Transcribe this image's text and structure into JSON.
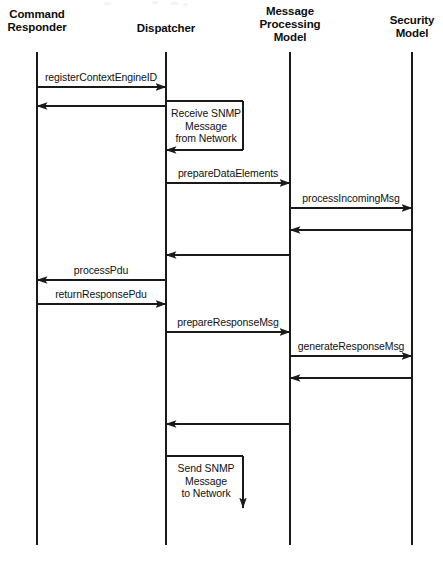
{
  "diagram": {
    "type": "uml-sequence-diagram",
    "width": 443,
    "height": 561,
    "background_color": "#ffffff",
    "line_color": "#1a1a1a",
    "text_color": "#111111",
    "lifeline_top": 52,
    "lifeline_bottom": 545
  },
  "participants": [
    {
      "id": "command-responder",
      "label": "Command\nResponder",
      "x": 37,
      "label_y": 8
    },
    {
      "id": "dispatcher",
      "label": "Dispatcher",
      "x": 166,
      "label_y": 22
    },
    {
      "id": "message-processing-model",
      "label": "Message\nProcessing\nModel",
      "x": 290,
      "label_y": 5
    },
    {
      "id": "security-model",
      "label": "Security\nModel",
      "x": 412,
      "label_y": 14
    }
  ],
  "messages": [
    {
      "id": "register-context-engine-id",
      "label": "registerContextEngineID",
      "from": "command-responder",
      "to": "dispatcher",
      "direction": "right",
      "y": 87,
      "label_x": 101,
      "label_y": 83,
      "kind": "call"
    },
    {
      "id": "register-context-engine-id-return",
      "label": "",
      "from": "dispatcher",
      "to": "command-responder",
      "direction": "left",
      "y": 106,
      "kind": "return"
    },
    {
      "id": "receive-snmp-message-from-network",
      "label": "Receive SNMP\nMessage\nfrom Network",
      "from": "dispatcher",
      "to": "dispatcher",
      "direction": "self-in",
      "y_top": 101,
      "y_bottom": 150,
      "x_out": 243,
      "label_x": 206,
      "label_y": 107,
      "kind": "self"
    },
    {
      "id": "prepare-data-elements",
      "label": "prepareDataElements",
      "from": "dispatcher",
      "to": "message-processing-model",
      "direction": "right",
      "y": 183,
      "label_x": 228,
      "label_y": 179,
      "kind": "call"
    },
    {
      "id": "process-incoming-msg",
      "label": "processIncomingMsg",
      "from": "message-processing-model",
      "to": "security-model",
      "direction": "right",
      "y": 208,
      "label_x": 351,
      "label_y": 204,
      "kind": "call"
    },
    {
      "id": "process-incoming-msg-return",
      "label": "",
      "from": "security-model",
      "to": "message-processing-model",
      "direction": "left",
      "y": 230,
      "kind": "return"
    },
    {
      "id": "prepare-data-elements-return",
      "label": "",
      "from": "message-processing-model",
      "to": "dispatcher",
      "direction": "left",
      "y": 255,
      "kind": "return"
    },
    {
      "id": "process-pdu",
      "label": "processPdu",
      "from": "dispatcher",
      "to": "command-responder",
      "direction": "left",
      "y": 280,
      "label_x": 101,
      "label_y": 276,
      "kind": "call"
    },
    {
      "id": "return-response-pdu",
      "label": "returnResponsePdu",
      "from": "command-responder",
      "to": "dispatcher",
      "direction": "right",
      "y": 304,
      "label_x": 101,
      "label_y": 300,
      "kind": "call"
    },
    {
      "id": "prepare-response-msg",
      "label": "prepareResponseMsg",
      "from": "dispatcher",
      "to": "message-processing-model",
      "direction": "right",
      "y": 332,
      "label_x": 228,
      "label_y": 328,
      "kind": "call"
    },
    {
      "id": "generate-response-msg",
      "label": "generateResponseMsg",
      "from": "message-processing-model",
      "to": "security-model",
      "direction": "right",
      "y": 356,
      "label_x": 351,
      "label_y": 352,
      "kind": "call"
    },
    {
      "id": "generate-response-msg-return",
      "label": "",
      "from": "security-model",
      "to": "message-processing-model",
      "direction": "left",
      "y": 378,
      "kind": "return"
    },
    {
      "id": "prepare-response-msg-return",
      "label": "",
      "from": "message-processing-model",
      "to": "dispatcher",
      "direction": "left",
      "y": 424,
      "kind": "return"
    },
    {
      "id": "send-snmp-message-to-network",
      "label": "Send SNMP\nMessage\nto Network",
      "from": "dispatcher",
      "to": "dispatcher",
      "direction": "self-out",
      "y_top": 456,
      "y_bottom": 508,
      "x_out": 243,
      "label_x": 206,
      "label_y": 462,
      "kind": "self"
    }
  ]
}
